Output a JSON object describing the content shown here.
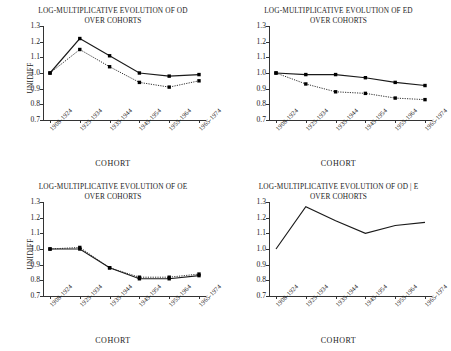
{
  "figure": {
    "panel_count": 4,
    "axis": {
      "y_label": "UNIDIFF",
      "x_label": "COHORT",
      "y_ticks": [
        "1.3",
        "1.2",
        "1.1",
        "1.0",
        "0.9",
        "0.8",
        "0.7"
      ],
      "x_ticks": [
        "1908-1924",
        "1925-1934",
        "1935-1944",
        "1945-1954",
        "1955-1964",
        "1965-1974"
      ]
    },
    "colors": {
      "line": "#1a1a1a",
      "marker": "#000000",
      "axis": "#333333",
      "background": "#ffffff"
    }
  },
  "chart_data": [
    {
      "type": "line",
      "title": "LOG-MULTIPLICATIVE EVOLUTION OF OD OVER COHORTS",
      "title_lines": [
        "LOG-MULTIPLICATIVE EVOLUTION OF OD",
        "OVER COHORTS"
      ],
      "xlabel": "COHORT",
      "ylabel": "UNIDIFF",
      "categories": [
        "1908-1924",
        "1925-1934",
        "1935-1944",
        "1945-1954",
        "1955-1964",
        "1965-1974"
      ],
      "ylim": [
        0.7,
        1.3
      ],
      "yticks": [
        0.7,
        0.8,
        0.9,
        1.0,
        1.1,
        1.2,
        1.3
      ],
      "grid": false,
      "legend": "none",
      "markers": true,
      "series": [
        {
          "name": "solid",
          "style": "solid",
          "values": [
            1.0,
            1.22,
            1.11,
            1.0,
            0.98,
            0.99
          ]
        },
        {
          "name": "dotted",
          "style": "dotted",
          "values": [
            1.0,
            1.15,
            1.04,
            0.94,
            0.91,
            0.95
          ]
        }
      ]
    },
    {
      "type": "line",
      "title": "LOG-MULTIPLICATIVE EVOLUTION OF ED OVER COHORTS",
      "title_lines": [
        "LOG-MULTIPLICATIVE EVOLUTION OF ED",
        "OVER COHORTS"
      ],
      "xlabel": "COHORT",
      "ylabel": "",
      "categories": [
        "1908-1924",
        "1925-1934",
        "1935-1944",
        "1945-1954",
        "1955-1964",
        "1965-1974"
      ],
      "ylim": [
        0.7,
        1.3
      ],
      "yticks": [
        0.7,
        0.8,
        0.9,
        1.0,
        1.1,
        1.2,
        1.3
      ],
      "grid": false,
      "legend": "none",
      "markers": true,
      "series": [
        {
          "name": "solid",
          "style": "solid",
          "values": [
            1.0,
            0.99,
            0.99,
            0.97,
            0.94,
            0.92
          ]
        },
        {
          "name": "dotted",
          "style": "dotted",
          "values": [
            1.0,
            0.93,
            0.88,
            0.87,
            0.84,
            0.83
          ]
        }
      ]
    },
    {
      "type": "line",
      "title": "LOG-MULTIPLICATIVE EVOLUTION OF OE OVER COHORTS",
      "title_lines": [
        "LOG-MULTIPLICATIVE EVOLUTION OF OE",
        "OVER COHORTS"
      ],
      "xlabel": "COHORT",
      "ylabel": "UNIDIFF",
      "categories": [
        "1908-1924",
        "1925-1934",
        "1935-1944",
        "1945-1954",
        "1955-1964",
        "1965-1974"
      ],
      "ylim": [
        0.7,
        1.3
      ],
      "yticks": [
        0.7,
        0.8,
        0.9,
        1.0,
        1.1,
        1.2,
        1.3
      ],
      "grid": false,
      "legend": "none",
      "markers": true,
      "series": [
        {
          "name": "solid",
          "style": "solid",
          "values": [
            1.0,
            1.0,
            0.88,
            0.81,
            0.81,
            0.83
          ]
        },
        {
          "name": "dotted",
          "style": "dotted",
          "values": [
            1.0,
            1.01,
            0.88,
            0.82,
            0.82,
            0.84
          ]
        }
      ]
    },
    {
      "type": "line",
      "title": "LOG-MULTIPLICATIVE EVOLUTION OF OD | E OVER COHORTS",
      "title_lines": [
        "LOG-MULTIPLICATIVE EVOLUTION OF OD | E",
        "OVER COHORTS"
      ],
      "xlabel": "COHORT",
      "ylabel": "",
      "categories": [
        "1908-1924",
        "1925-1934",
        "1935-1944",
        "1945-1954",
        "1955-1964",
        "1965-1974"
      ],
      "ylim": [
        0.7,
        1.3
      ],
      "yticks": [
        0.7,
        0.8,
        0.9,
        1.0,
        1.1,
        1.2,
        1.3
      ],
      "grid": false,
      "legend": "none",
      "markers": false,
      "series": [
        {
          "name": "solid",
          "style": "solid",
          "values": [
            1.0,
            1.27,
            1.18,
            1.1,
            1.15,
            1.17
          ]
        }
      ]
    }
  ]
}
